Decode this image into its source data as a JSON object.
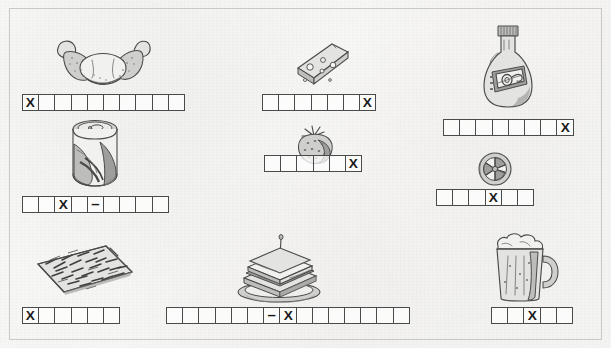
{
  "worksheet": {
    "title": "Food vocabulary crossword answer strips",
    "background_color": "#f7f7f5",
    "ink_color": "#4b4b4b",
    "border_color": "#c9c9c7"
  },
  "items": [
    {
      "id": "croissant",
      "picture_label": "croissant-illustration",
      "row_label": "answer-row-croissant",
      "cell_count": 10,
      "marks": [
        "X",
        "",
        "",
        "",
        "",
        "",
        "",
        "",
        "",
        ""
      ]
    },
    {
      "id": "cheese",
      "picture_label": "cheese-wedge-illustration",
      "row_label": "answer-row-cheese",
      "cell_count": 7,
      "marks": [
        "",
        "",
        "",
        "",
        "",
        "",
        "X"
      ]
    },
    {
      "id": "bottle",
      "picture_label": "sauce-bottle-illustration",
      "row_label": "answer-row-bottle",
      "cell_count": 8,
      "marks": [
        "",
        "",
        "",
        "",
        "",
        "",
        "",
        "X"
      ]
    },
    {
      "id": "cola-can",
      "picture_label": "cola-can-illustration",
      "row_label": "answer-row-cola-can",
      "cell_count": 9,
      "marks": [
        "",
        "",
        "X",
        "",
        "–",
        "",
        "",
        "",
        ""
      ]
    },
    {
      "id": "strawberry",
      "picture_label": "strawberry-illustration",
      "row_label": "answer-row-strawberry",
      "cell_count": 6,
      "marks": [
        "",
        "",
        "",
        "",
        "",
        "X"
      ]
    },
    {
      "id": "candy-swirl",
      "picture_label": "swirl-candy-illustration",
      "row_label": "answer-row-candy-swirl",
      "cell_count": 6,
      "marks": [
        "",
        "",
        "",
        "X",
        "",
        ""
      ]
    },
    {
      "id": "fries",
      "picture_label": "french-fries-illustration",
      "row_label": "answer-row-fries",
      "cell_count": 6,
      "marks": [
        "X",
        "",
        "",
        "",
        "",
        ""
      ]
    },
    {
      "id": "sandwich",
      "picture_label": "club-sandwich-illustration",
      "row_label": "answer-row-sandwich",
      "cell_count": 15,
      "marks": [
        "",
        "",
        "",
        "",
        "",
        "",
        "–",
        "X",
        "",
        "",
        "",
        "",
        "",
        "",
        ""
      ]
    },
    {
      "id": "beer-mug",
      "picture_label": "beer-mug-illustration",
      "row_label": "answer-row-beer-mug",
      "cell_count": 5,
      "marks": [
        "",
        "",
        "X",
        "",
        ""
      ]
    }
  ],
  "legend": {
    "cross_mark": "X",
    "dash_mark": "–"
  }
}
